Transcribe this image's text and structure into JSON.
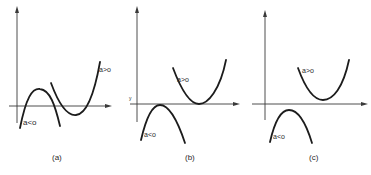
{
  "figure": {
    "panels": [
      {
        "id": "a",
        "caption": "(a)",
        "kind": "cubic",
        "curves": [
          {
            "label": "a<o",
            "description": "cubic with a < 0"
          },
          {
            "label": "a>o",
            "description": "cubic with a > 0"
          }
        ]
      },
      {
        "id": "b",
        "caption": "(b)",
        "kind": "parabola-tangent",
        "axis_mark": "y",
        "curves": [
          {
            "label": "a>o",
            "description": "upward parabola touching x-axis"
          },
          {
            "label": "a<o",
            "description": "downward parabola touching x-axis"
          }
        ]
      },
      {
        "id": "c",
        "caption": "(c)",
        "kind": "parabola-no-roots",
        "curves": [
          {
            "label": "a>o",
            "description": "upward parabola above x-axis"
          },
          {
            "label": "a<o",
            "description": "downward parabola below x-axis"
          }
        ]
      }
    ],
    "colors": {
      "background": "#ffffff",
      "ink": "#1c1c1c"
    }
  }
}
